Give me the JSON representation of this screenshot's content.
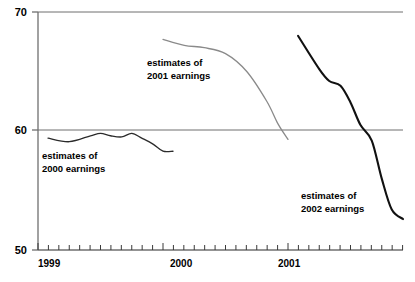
{
  "chart_data": {
    "type": "line",
    "title": "",
    "subtitle": "",
    "xlabel": "",
    "ylabel": "",
    "ylim": [
      50,
      70
    ],
    "xlim": [
      1999.0,
      2001.92
    ],
    "grid": false,
    "gridlines_y": [
      60,
      70
    ],
    "legend": "inline-annotations",
    "y_ticks": [
      "70",
      "60",
      "50"
    ],
    "y_tick_values": [
      70,
      60,
      50
    ],
    "x_ticks": [
      "1999",
      "2000",
      "2001"
    ],
    "x_tick_values": [
      1999,
      2000,
      2001
    ],
    "x_minor_tick_interval_months": 1,
    "series": [
      {
        "name": "estimates of 2000 earnings",
        "color": "#2b2b2b",
        "annotation": "estimates of\n2000 earnings",
        "annotation_line1": "estimates of",
        "annotation_line2": "2000 earnings",
        "x": [
          1999.08,
          1999.25,
          1999.42,
          1999.5,
          1999.58,
          1999.67,
          1999.75,
          1999.83,
          1999.92,
          2000.0,
          2000.08
        ],
        "values": [
          59.4,
          59.1,
          59.6,
          59.8,
          59.6,
          59.5,
          59.8,
          59.4,
          58.9,
          58.3,
          58.3
        ]
      },
      {
        "name": "estimates of 2001 earnings",
        "color": "#8a8a8a",
        "annotation": "estimates of\n2001 earnings",
        "annotation_line1": "estimates of",
        "annotation_line2": "2001 earnings",
        "x": [
          2000.0,
          2000.17,
          2000.33,
          2000.5,
          2000.67,
          2000.83,
          2000.92,
          2001.0
        ],
        "values": [
          67.7,
          67.2,
          67.0,
          66.5,
          65.0,
          62.5,
          60.6,
          59.3
        ]
      },
      {
        "name": "estimates of 2002 earnings",
        "color": "#111111",
        "annotation": "estimates of\n2002 earnings",
        "annotation_line1": "estimates of",
        "annotation_line2": "2002 earnings",
        "x": [
          2001.08,
          2001.25,
          2001.33,
          2001.42,
          2001.5,
          2001.58,
          2001.67,
          2001.75,
          2001.83,
          2001.92
        ],
        "values": [
          68.0,
          65.2,
          64.2,
          63.8,
          62.4,
          60.5,
          59.2,
          56.0,
          53.4,
          52.6
        ]
      }
    ]
  },
  "axis": {
    "y_tick_top": "70",
    "y_tick_mid": "60",
    "y_tick_bottom": "50",
    "x_tick_1": "1999",
    "x_tick_2": "2000",
    "x_tick_3": "2001"
  },
  "annotations": {
    "s2000_line1": "estimates of",
    "s2000_line2": "2000 earnings",
    "s2001_line1": "estimates of",
    "s2001_line2": "2001 earnings",
    "s2002_line1": "estimates of",
    "s2002_line2": "2002 earnings"
  },
  "colors": {
    "axis": "#6f6f6f",
    "gridline": "#6f6f6f",
    "series_2000": "#2b2b2b",
    "series_2001": "#8a8a8a",
    "series_2002": "#111111",
    "background": "#ffffff",
    "text": "#000000"
  }
}
